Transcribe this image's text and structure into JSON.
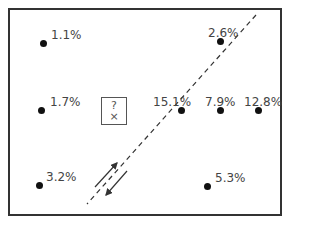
{
  "diagram": {
    "points": [
      {
        "label": "1.1%",
        "dot": [
          43,
          43
        ],
        "text": [
          51,
          29
        ]
      },
      {
        "label": "2.6%",
        "dot": [
          220,
          41
        ],
        "text": [
          208,
          27
        ]
      },
      {
        "label": "1.7%",
        "dot": [
          41,
          110
        ],
        "text": [
          50,
          96
        ]
      },
      {
        "label": "15.1%",
        "dot": [
          181,
          110
        ],
        "text": [
          153,
          96
        ]
      },
      {
        "label": "7.9%",
        "dot": [
          220,
          110
        ],
        "text": [
          205,
          96
        ]
      },
      {
        "label": "12.8%",
        "dot": [
          258,
          110
        ],
        "text": [
          244,
          96
        ]
      },
      {
        "label": "3.2%",
        "dot": [
          39,
          185
        ],
        "text": [
          46,
          171
        ]
      },
      {
        "label": "5.3%",
        "dot": [
          207,
          186
        ],
        "text": [
          215,
          172
        ]
      }
    ],
    "unknown_box": {
      "question": "?",
      "mark": "×"
    },
    "dashed_line": {
      "from": [
        256,
        15
      ],
      "to": [
        87,
        204
      ]
    },
    "arrows": {
      "up": {
        "from": [
          95,
          187
        ],
        "to": [
          117,
          163
        ]
      },
      "down": {
        "from": [
          127,
          171
        ],
        "to": [
          106,
          195
        ]
      }
    }
  }
}
